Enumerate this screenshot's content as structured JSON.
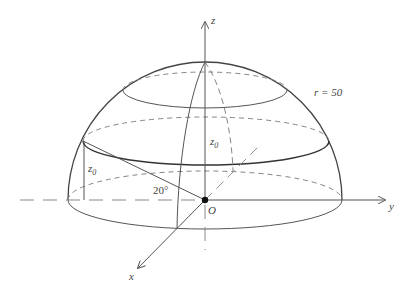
{
  "diagram": {
    "type": "hemisphere-3d",
    "labels": {
      "z_axis": "z",
      "y_axis": "y",
      "x_axis": "x",
      "origin": "O",
      "radius": "r = 50",
      "height_center": "z",
      "height_center_sub": "0",
      "height_left": "z",
      "height_left_sub": "0",
      "angle": "20°"
    },
    "colors": {
      "line": "#555555",
      "dash": "#777777",
      "background": "#ffffff"
    }
  }
}
